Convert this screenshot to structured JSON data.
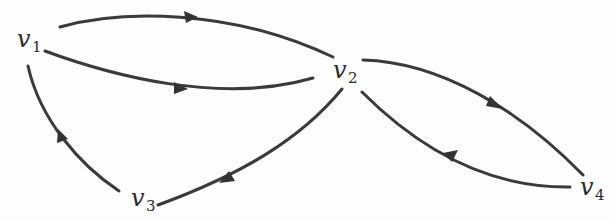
{
  "diagram": {
    "type": "directed-graph",
    "colors": {
      "stroke": "#3a3a3a",
      "text": "#2a2a2a",
      "background": "#fdfdfd"
    },
    "nodes": [
      {
        "id": "v1",
        "base": "v",
        "subscript": "1"
      },
      {
        "id": "v2",
        "base": "v",
        "subscript": "2"
      },
      {
        "id": "v3",
        "base": "v",
        "subscript": "3"
      },
      {
        "id": "v4",
        "base": "v",
        "subscript": "4"
      }
    ],
    "edges": [
      {
        "from": "v1",
        "to": "v2",
        "label": "upper"
      },
      {
        "from": "v1",
        "to": "v2",
        "label": "lower"
      },
      {
        "from": "v2",
        "to": "v4",
        "label": "upper"
      },
      {
        "from": "v4",
        "to": "v2",
        "label": "lower"
      },
      {
        "from": "v2",
        "to": "v3",
        "label": ""
      },
      {
        "from": "v3",
        "to": "v1",
        "label": ""
      }
    ]
  }
}
